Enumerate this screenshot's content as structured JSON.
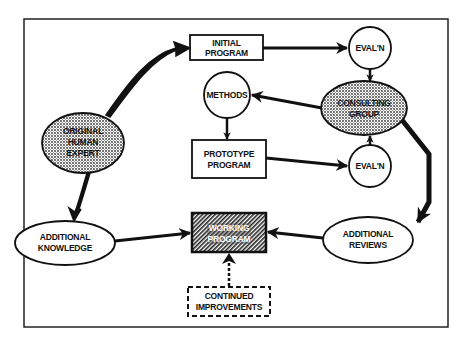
{
  "diagram": {
    "type": "flowchart",
    "colors": {
      "ink": "#111111",
      "background": "#ffffff",
      "stipple_fill": "#c8c8c8",
      "hatch_fill": "#555555"
    },
    "nodes": {
      "original_expert": {
        "shape": "stippled-ellipse",
        "lines": [
          "ORIGINAL",
          "HUMAN",
          "EXPERT"
        ]
      },
      "initial_program": {
        "shape": "box",
        "lines": [
          "INITIAL",
          "PROGRAM"
        ]
      },
      "evaln_top": {
        "shape": "circle",
        "lines": [
          "EVAL'N"
        ]
      },
      "consulting_group": {
        "shape": "stippled-ellipse",
        "lines": [
          "CONSULTING",
          "GROUP"
        ]
      },
      "methods": {
        "shape": "circle",
        "lines": [
          "METHODS"
        ]
      },
      "prototype_program": {
        "shape": "box",
        "lines": [
          "PROTOTYPE",
          "PROGRAM"
        ]
      },
      "evaln_bottom": {
        "shape": "circle",
        "lines": [
          "EVAL'N"
        ]
      },
      "additional_knowledge": {
        "shape": "ellipse",
        "lines": [
          "ADDITIONAL",
          "KNOWLEDGE"
        ]
      },
      "working_program": {
        "shape": "hatched-box",
        "lines": [
          "WORKING",
          "PROGRAM"
        ]
      },
      "additional_reviews": {
        "shape": "ellipse",
        "lines": [
          "ADDITIONAL",
          "REVIEWS"
        ]
      },
      "continued_improvements": {
        "shape": "dashed-box",
        "lines": [
          "CONTINUED",
          "IMPROVEMENTS"
        ]
      }
    },
    "edges": [
      {
        "from": "ORIGINAL HUMAN EXPERT",
        "to": "INITIAL PROGRAM",
        "style": "thick-curved"
      },
      {
        "from": "ORIGINAL HUMAN EXPERT",
        "to": "ADDITIONAL KNOWLEDGE",
        "style": "thick-curved"
      },
      {
        "from": "INITIAL PROGRAM",
        "to": "EVAL'N (top)",
        "style": "solid"
      },
      {
        "from": "EVAL'N (top)",
        "to": "CONSULTING GROUP",
        "style": "solid"
      },
      {
        "from": "CONSULTING GROUP",
        "to": "METHODS",
        "style": "solid"
      },
      {
        "from": "METHODS",
        "to": "PROTOTYPE PROGRAM",
        "style": "solid"
      },
      {
        "from": "PROTOTYPE PROGRAM",
        "to": "EVAL'N (bottom)",
        "style": "solid"
      },
      {
        "from": "EVAL'N (bottom)",
        "to": "CONSULTING GROUP",
        "style": "solid"
      },
      {
        "from": "CONSULTING GROUP",
        "to": "ADDITIONAL REVIEWS",
        "style": "thick"
      },
      {
        "from": "ADDITIONAL REVIEWS",
        "to": "WORKING PROGRAM",
        "style": "solid"
      },
      {
        "from": "ADDITIONAL KNOWLEDGE",
        "to": "WORKING PROGRAM",
        "style": "solid"
      },
      {
        "from": "CONTINUED IMPROVEMENTS",
        "to": "WORKING PROGRAM",
        "style": "dashed"
      }
    ]
  }
}
